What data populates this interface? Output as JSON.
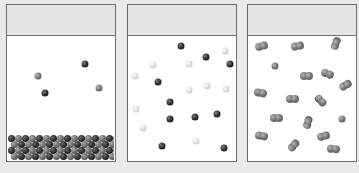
{
  "figure": {
    "background_color": "#e9e9e9",
    "panel_border_color": "#6d6d6d",
    "header_color": "#e4e4e4"
  },
  "panels": [
    {
      "id": "panel-1",
      "label": "",
      "content": "solid lattice of alternating dark and gray atoms at bottom with a few free atoms above",
      "particles": [
        {
          "type": "gray",
          "x": 31,
          "y": 71
        },
        {
          "type": "dark",
          "x": 78,
          "y": 59
        },
        {
          "type": "dark",
          "x": 38,
          "y": 88
        },
        {
          "type": "gray",
          "x": 92,
          "y": 83
        }
      ],
      "lattice": {
        "rows": 4,
        "columns": 16,
        "pattern": "alternating dark/gray"
      }
    },
    {
      "id": "panel-2",
      "label": "",
      "content": "mixture of dark and light monatomic particles",
      "particles": [
        {
          "type": "dark",
          "x": 53,
          "y": 41
        },
        {
          "type": "light",
          "x": 97,
          "y": 46
        },
        {
          "type": "dark",
          "x": 78,
          "y": 52
        },
        {
          "type": "dark",
          "x": 102,
          "y": 59
        },
        {
          "type": "light",
          "x": 25,
          "y": 60
        },
        {
          "type": "light",
          "x": 61,
          "y": 59
        },
        {
          "type": "light",
          "x": 7,
          "y": 71
        },
        {
          "type": "dark",
          "x": 30,
          "y": 77
        },
        {
          "type": "light",
          "x": 61,
          "y": 85
        },
        {
          "type": "light",
          "x": 79,
          "y": 81
        },
        {
          "type": "light",
          "x": 98,
          "y": 84
        },
        {
          "type": "dark",
          "x": 42,
          "y": 97
        },
        {
          "type": "light",
          "x": 8,
          "y": 104
        },
        {
          "type": "dark",
          "x": 42,
          "y": 114
        },
        {
          "type": "dark",
          "x": 67,
          "y": 112
        },
        {
          "type": "dark",
          "x": 89,
          "y": 109
        },
        {
          "type": "light",
          "x": 15,
          "y": 123
        },
        {
          "type": "dark",
          "x": 34,
          "y": 141
        },
        {
          "type": "light",
          "x": 68,
          "y": 136
        },
        {
          "type": "dark",
          "x": 96,
          "y": 143
        }
      ]
    },
    {
      "id": "panel-3",
      "label": "",
      "content": "diatomic gray molecules with a few single atoms",
      "molecules": [
        {
          "type": "diatomic",
          "x": 14,
          "y": 41,
          "angle": -15
        },
        {
          "type": "diatomic",
          "x": 50,
          "y": 41,
          "angle": -10
        },
        {
          "type": "diatomic",
          "x": 88,
          "y": 38,
          "angle": -70
        },
        {
          "type": "single",
          "x": 27,
          "y": 61
        },
        {
          "type": "diatomic",
          "x": 59,
          "y": 71,
          "angle": 0
        },
        {
          "type": "diatomic",
          "x": 80,
          "y": 69,
          "angle": 20
        },
        {
          "type": "diatomic",
          "x": 98,
          "y": 80,
          "angle": -30
        },
        {
          "type": "diatomic",
          "x": 13,
          "y": 88,
          "angle": 10
        },
        {
          "type": "diatomic",
          "x": 45,
          "y": 94,
          "angle": 0
        },
        {
          "type": "diatomic",
          "x": 73,
          "y": 96,
          "angle": 45
        },
        {
          "type": "diatomic",
          "x": 29,
          "y": 113,
          "angle": 0
        },
        {
          "type": "diatomic",
          "x": 60,
          "y": 117,
          "angle": -75
        },
        {
          "type": "single",
          "x": 94,
          "y": 114
        },
        {
          "type": "diatomic",
          "x": 14,
          "y": 131,
          "angle": 10
        },
        {
          "type": "diatomic",
          "x": 46,
          "y": 140,
          "angle": -50
        },
        {
          "type": "diatomic",
          "x": 76,
          "y": 131,
          "angle": -15
        },
        {
          "type": "diatomic",
          "x": 86,
          "y": 144,
          "angle": 5
        }
      ]
    }
  ]
}
